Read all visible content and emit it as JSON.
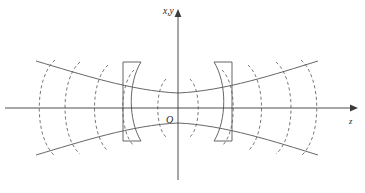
{
  "figure": {
    "domain_kind": "diagram",
    "title_visible": false,
    "background_color": "#ffffff",
    "line_color": "#555555",
    "axis_color": "#3b3b3b",
    "wavefront_color": "#6a6a6a"
  },
  "labels": {
    "vertical_axis": "x,y",
    "horizontal_axis": "z",
    "origin": "O"
  },
  "geometry": {
    "origin": {
      "x": 178,
      "y": 108
    },
    "z_axis": {
      "x_start": 5,
      "x_end": 352,
      "y": 108
    },
    "xy_axis": {
      "x": 178,
      "y_start": 14,
      "y_end": 180
    },
    "beam_waist_half_width": 14,
    "rayleigh_range": 62,
    "divergence_span_x": [
      36,
      318
    ],
    "envelope_half_width_at_edge": 47
  },
  "mirrors": [
    {
      "name": "left-mirror",
      "side": "left",
      "left_edge_x": 123,
      "right_edge_x": 141,
      "top_y": 62,
      "bottom_y": 141,
      "curvature": "concave-toward-center"
    },
    {
      "name": "right-mirror",
      "side": "right",
      "left_edge_x": 212,
      "right_edge_x": 232,
      "top_y": 62,
      "bottom_y": 141,
      "curvature": "concave-toward-center"
    }
  ],
  "wavefronts": {
    "count": 12,
    "style": "dashed-arc",
    "note": "Curved phase fronts, flat at the waist and increasingly curved away from it",
    "z_positions": [
      -140,
      -112,
      -86,
      -62,
      -34,
      -16,
      16,
      34,
      62,
      86,
      112,
      140
    ]
  }
}
